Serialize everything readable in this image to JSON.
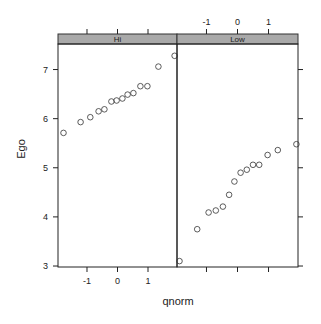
{
  "chart_data": {
    "type": "scatter",
    "title": "",
    "xlabel": "qnorm",
    "ylabel": "Ego",
    "ylim": [
      2.98,
      7.52
    ],
    "xlim": [
      -1.95,
      1.95
    ],
    "y_ticks": [
      3,
      4,
      5,
      6,
      7
    ],
    "x_ticks": [
      -1,
      0,
      1
    ],
    "grid": false,
    "legend": null,
    "layout": "lattice 2 panels side by side, strip labels on top",
    "panels": [
      {
        "name": "Hi",
        "x": [
          -1.77,
          -1.21,
          -0.89,
          -0.62,
          -0.43,
          -0.2,
          -0.03,
          0.16,
          0.33,
          0.52,
          0.75,
          0.98,
          1.34,
          1.87
        ],
        "y": [
          5.71,
          5.93,
          6.03,
          6.15,
          6.19,
          6.35,
          6.37,
          6.41,
          6.49,
          6.52,
          6.66,
          6.66,
          7.06,
          7.28
        ]
      },
      {
        "name": "Low",
        "x": [
          -1.87,
          -1.3,
          -0.93,
          -0.7,
          -0.47,
          -0.27,
          -0.1,
          0.1,
          0.3,
          0.5,
          0.7,
          0.97,
          1.3,
          1.9
        ],
        "y": [
          3.1,
          3.75,
          4.09,
          4.13,
          4.21,
          4.45,
          4.72,
          4.9,
          4.96,
          5.06,
          5.06,
          5.26,
          5.36,
          5.48
        ]
      }
    ]
  },
  "labels": {
    "xlabel": "qnorm",
    "ylabel": "Ego",
    "strip_hi": "Hi",
    "strip_low": "Low"
  },
  "colors": {
    "strip": "#a9a9a9",
    "axis": "#222222",
    "point": "#333333"
  }
}
